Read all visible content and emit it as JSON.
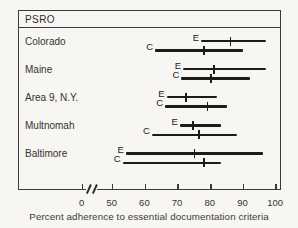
{
  "page": {
    "background": "#f7f6f2",
    "ink": "#1b1b1b"
  },
  "chart_data": {
    "type": "range-bar",
    "header": "PSRO",
    "xlabel": "Percent adherence to essential documentation criteria",
    "x_ticks": [
      "0",
      "50",
      "60",
      "70",
      "80",
      "90",
      "100"
    ],
    "axis_break": true,
    "axis_break_between": [
      "0",
      "50"
    ],
    "xlim": [
      0,
      100
    ],
    "series_labels": [
      "E",
      "C"
    ],
    "categories": [
      "Colorado",
      "Maine",
      "Area 9, N.Y.",
      "Multnomah",
      "Baltimore"
    ],
    "rows": [
      {
        "category": "Colorado",
        "E": {
          "range": [
            77,
            97
          ],
          "mean": 86
        },
        "C": {
          "range": [
            63,
            90
          ],
          "mean": 78
        }
      },
      {
        "category": "Maine",
        "E": {
          "range": [
            71.5,
            97
          ],
          "mean": 81
        },
        "C": {
          "range": [
            71,
            92
          ],
          "mean": 80
        }
      },
      {
        "category": "Area 9, N.Y.",
        "E": {
          "range": [
            66.5,
            82
          ],
          "mean": 72.5
        },
        "C": {
          "range": [
            66,
            85
          ],
          "mean": 79
        }
      },
      {
        "category": "Multnomah",
        "E": {
          "range": [
            70.5,
            83
          ],
          "mean": 74.5
        },
        "C": {
          "range": [
            62,
            88
          ],
          "mean": 76.5
        }
      },
      {
        "category": "Baltimore",
        "E": {
          "range": [
            54,
            96
          ],
          "mean": 75
        },
        "C": {
          "range": [
            53,
            83
          ],
          "mean": 78
        }
      }
    ]
  }
}
